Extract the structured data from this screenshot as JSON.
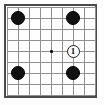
{
  "diagram": {
    "title": "Go board diagram",
    "board": {
      "columns": 9,
      "rows": 9,
      "cell_size": 11,
      "origin_x": 7,
      "origin_y": 7,
      "frame_color": "#4a4a4a",
      "grid_color": "#8f8f8f",
      "background_color": "#fefefe"
    },
    "star_points": [
      {
        "name": "center-star-point",
        "col": 4,
        "row": 4,
        "size": 3,
        "color": "#101010"
      }
    ],
    "stones": [
      {
        "name": "black-stone-top-left",
        "color": "black",
        "col": 1,
        "row": 1,
        "radius": 7,
        "label": ""
      },
      {
        "name": "black-stone-top-right",
        "color": "black",
        "col": 6,
        "row": 1,
        "radius": 7,
        "label": ""
      },
      {
        "name": "black-stone-bottom-left",
        "color": "black",
        "col": 1,
        "row": 6,
        "radius": 7,
        "label": ""
      },
      {
        "name": "black-stone-bottom-right",
        "color": "black",
        "col": 6,
        "row": 6,
        "radius": 7,
        "label": ""
      },
      {
        "name": "white-stone-move-1",
        "color": "white",
        "col": 6,
        "row": 4,
        "radius": 6.5,
        "label": "1"
      }
    ],
    "move_labels": {
      "move_1": "1"
    },
    "colors": {
      "black_stone": "#111111",
      "white_stone": "#ffffff",
      "stone_outline": "#1a1a1a",
      "label_text": "#101010"
    }
  }
}
